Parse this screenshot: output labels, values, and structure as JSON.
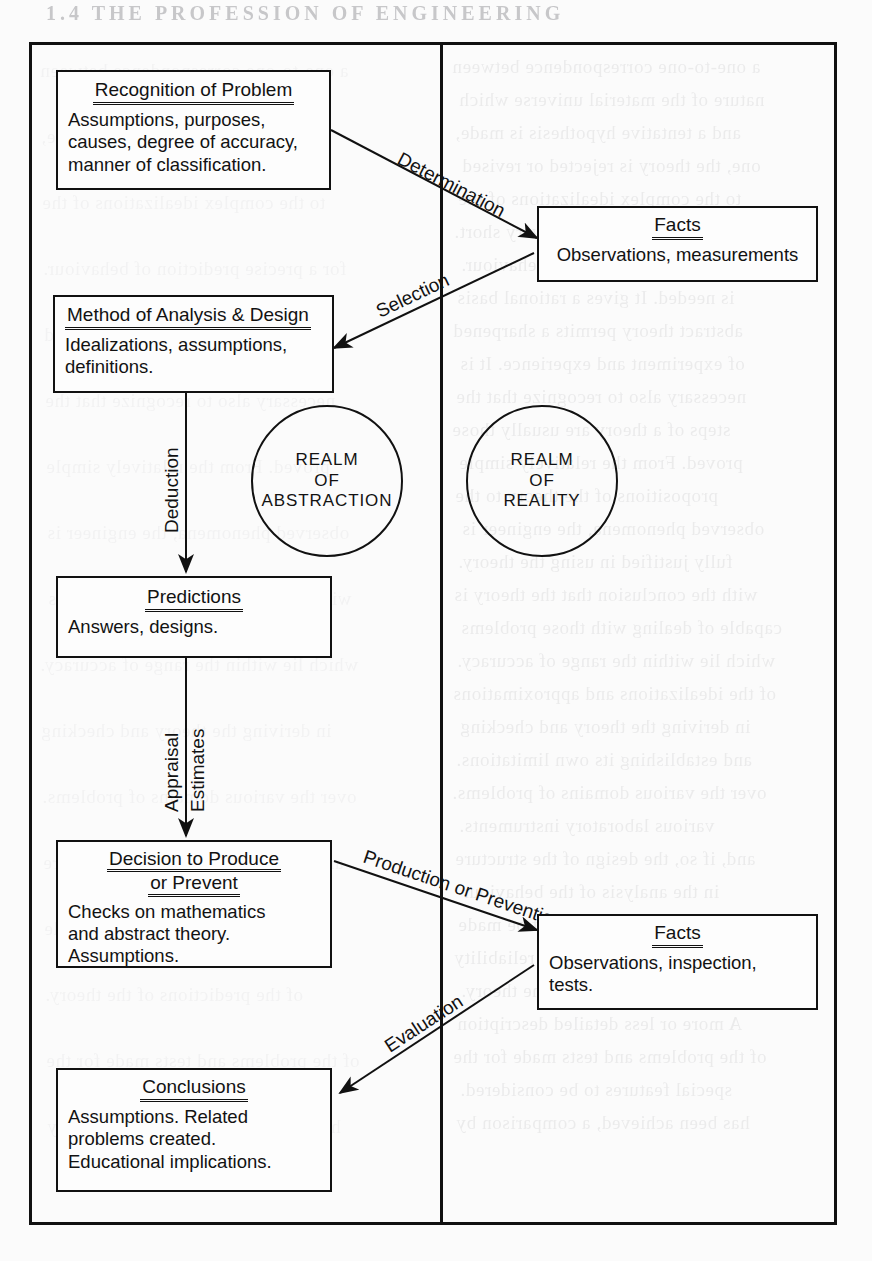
{
  "page": {
    "header_ghost": "1.4   THE PROFESSION OF ENGINEERING",
    "width": 872,
    "height": 1261,
    "background": "#fbfbfb",
    "ink": "#111111"
  },
  "frame": {
    "realm_divider_label": "vertical-divider"
  },
  "realms": [
    {
      "id": "abstraction",
      "lines": [
        "REALM",
        "OF",
        "ABSTRACTION"
      ]
    },
    {
      "id": "reality",
      "lines": [
        "REALM",
        "OF",
        "REALITY"
      ]
    }
  ],
  "nodes": [
    {
      "id": "recognition-of-problem",
      "title": "Recognition of Problem",
      "body": [
        "Assumptions, purposes,",
        "causes, degree of accuracy,",
        "manner of classification."
      ]
    },
    {
      "id": "facts-upper",
      "title": "Facts",
      "body": [
        "Observations, measurements"
      ]
    },
    {
      "id": "method-of-analysis",
      "title": "Method of Analysis & Design",
      "body": [
        "Idealizations, assumptions,",
        "definitions."
      ]
    },
    {
      "id": "predictions",
      "title": "Predictions",
      "body": [
        "Answers,  designs."
      ]
    },
    {
      "id": "decision-to-produce",
      "title": "Decision to Produce",
      "title2": "or Prevent",
      "body": [
        "Checks on mathematics",
        "and abstract theory.",
        "Assumptions."
      ]
    },
    {
      "id": "facts-lower",
      "title": "Facts",
      "body": [
        "Observations, inspection,",
        "tests."
      ]
    },
    {
      "id": "conclusions",
      "title": "Conclusions",
      "body": [
        "Assumptions. Related",
        "problems created.",
        "Educational implications."
      ]
    }
  ],
  "edge_labels": {
    "determination": "Determination",
    "selection": "Selection",
    "deduction": "Deduction",
    "appraisal": "Appraisal",
    "estimates": "Estimates",
    "production_or_prevention": "Production or Prevention",
    "evaluation": "Evaluation"
  },
  "ghost_text": {
    "column_right_top": [
      "a one-to-one correspondence between",
      "nature of the material universe which",
      "and a tentative hypothesis is made,",
      "one, the theory is rejected or revised",
      "to the complex idealizations of the",
      "theory may be very long or very short.",
      "for a precise prediction of behaviour.",
      "is needed. It gives a rational basis",
      "abstract theory permits a sharpened",
      "of experiment and experience. It is",
      "necessary also to recognize that the",
      "steps of a theory are usually those",
      "proved. From the relatively simple",
      "propositions of the theory to the",
      "observed phenomena, the engineer is",
      "fully justified in using the theory.",
      "with the conclusion that the theory is",
      "capable of dealing with those problems",
      "which lie within the range of accuracy.",
      "of the idealizations and approximations",
      "in deriving the theory and checking",
      "and establishing its own limitations.",
      "over the various domains of problems.",
      "various laboratory instruments.",
      "and, if so, the design of the structure",
      "in the analysis of the behaviour",
      "and abstract theory must be made",
      "in order to establish the reliability",
      "of the predictions of the theory.",
      "A more or less detailed description",
      "of the problems and tests made for the",
      "special features to be considered.",
      "has been achieved, a comparison by"
    ]
  }
}
